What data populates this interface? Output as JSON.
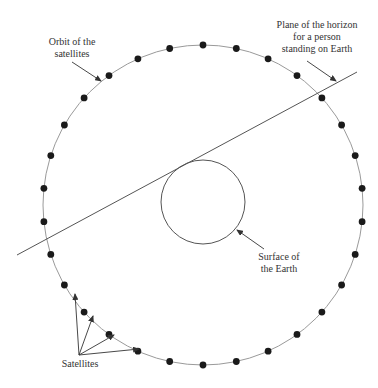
{
  "diagram": {
    "labels": {
      "orbit_line1": "Orbit of the",
      "orbit_line2": "satellites",
      "horizon_line1": "Plane of  the horizon",
      "horizon_line2": "for a person",
      "horizon_line3": "standing on Earth",
      "earth_line1": "Surface of",
      "earth_line2": "the Earth",
      "satellites": "Satellites"
    },
    "orbit": {
      "cx": 203,
      "cy": 205,
      "r": 160,
      "satellite_count": 30
    },
    "earth": {
      "cx": 203,
      "cy": 202,
      "r": 42
    },
    "horizon_line": {
      "x1": 17,
      "y1": 255,
      "x2": 357,
      "y2": 72
    },
    "colors": {
      "orbit": "#9a9a9a",
      "line": "#555555",
      "satellite": "#1a1a1a",
      "text": "#333333"
    }
  }
}
